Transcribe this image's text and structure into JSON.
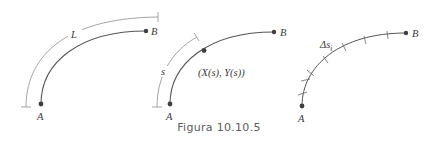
{
  "caption": "Figura 10.10.5",
  "colors": {
    "curve": "#555555",
    "bracket": "#9a9a9a",
    "point": "#3f3f3f",
    "text": "#3a3a3a",
    "caption": "#5b5b5b"
  },
  "panels": [
    {
      "id": "arc-length",
      "points": {
        "start": "A",
        "end": "B"
      },
      "bracket_label": "L"
    },
    {
      "id": "parametrization",
      "points": {
        "start": "A",
        "end": "B"
      },
      "bracket_label": "s",
      "point_label": "(X(s), Y(s))"
    },
    {
      "id": "subdivision",
      "points": {
        "start": "A",
        "end": "B"
      },
      "segment_label": "Δs",
      "segment_subscript": "i"
    }
  ]
}
